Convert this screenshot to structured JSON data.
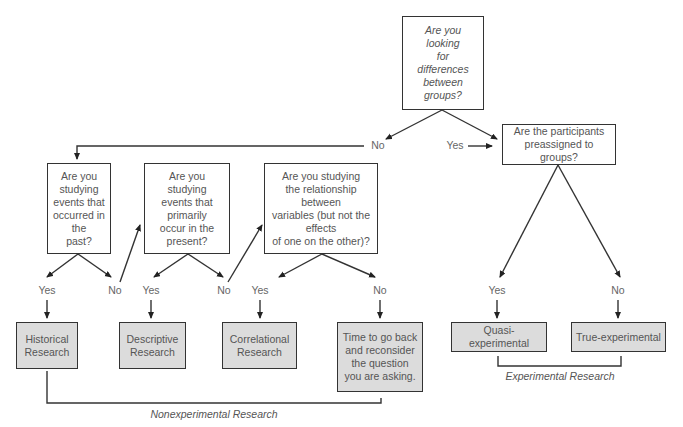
{
  "diagram": {
    "type": "decision-flowchart",
    "nodes": {
      "q_differences": "Are you\nlooking\nfor\ndifferences\nbetween\ngroups?",
      "q_preassigned": "Are the participants\npreassigned to groups?",
      "q_past": "Are you\nstudying\nevents that\noccurred in\nthe\npast?",
      "q_present": "Are you\nstudying\nevents that\nprimarily\noccur in the\npresent?",
      "q_relationship": "Are you studying\nthe relationship\nbetween\nvariables (but not the\neffects\nof one on the other)?",
      "r_historical": "Historical\nResearch",
      "r_descriptive": "Descriptive\nResearch",
      "r_correlational": "Correlational\nResearch",
      "r_reconsider": "Time to go back\nand reconsider\nthe question\nyou are asking.",
      "r_quasi": "Quasi-experimental",
      "r_true": "True-experimental"
    },
    "edge_labels": {
      "diff_no": "No",
      "diff_yes": "Yes",
      "past_yes": "Yes",
      "past_no": "No",
      "present_yes": "Yes",
      "present_no": "No",
      "relationship_yes": "Yes",
      "relationship_no": "No",
      "preassigned_yes": "Yes",
      "preassigned_no": "No"
    },
    "groups": {
      "nonexperimental": "Nonexperimental Research",
      "experimental": "Experimental Research"
    },
    "colors": {
      "line": "#333333",
      "text": "#555555",
      "result_fill": "#dcdcdc"
    }
  }
}
